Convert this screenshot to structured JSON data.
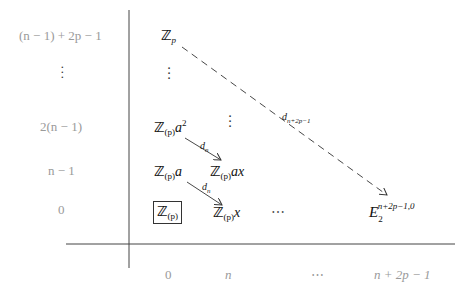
{
  "diagram": {
    "type": "spectral-sequence-page",
    "row_labels": [
      "(n − 1) + 2p − 1",
      "⋮",
      "2(n − 1)",
      "n − 1",
      "0"
    ],
    "column_labels": [
      "0",
      "n",
      "⋯",
      "n + 2p − 1"
    ],
    "entries": {
      "top": {
        "base": "ℤ",
        "sub": "p"
      },
      "col0_vdots": "⋮",
      "a2": {
        "base": "ℤ",
        "sub": "(p)",
        "tail": "a",
        "sup": "2"
      },
      "coln_vdots": "⋮",
      "a": {
        "base": "ℤ",
        "sub": "(p)",
        "tail": "a"
      },
      "ax": {
        "base": "ℤ",
        "sub": "(p)",
        "tail": "ax"
      },
      "origin_boxed": {
        "base": "ℤ",
        "sub": "(p)"
      },
      "x": {
        "base": "ℤ",
        "sub": "(p)",
        "tail": "x"
      },
      "row0_dots": "⋯",
      "target": {
        "base": "E",
        "sub": "2",
        "sup": "n+2p−1,0"
      }
    },
    "differentials": [
      {
        "label_base": "d",
        "label_sub": "n",
        "from": "Z(p)a^2",
        "to": "Z(p)ax",
        "style": "solid"
      },
      {
        "label_base": "d",
        "label_sub": "n",
        "from": "Z(p)a",
        "to": "Z(p)x",
        "style": "solid"
      },
      {
        "label_base": "d",
        "label_sub": "n+2p−1",
        "from": "Zp",
        "to": "E2^{n+2p-1,0}",
        "style": "dashed"
      }
    ],
    "colors": {
      "axis": "#444444",
      "axis_labels": "#9a9a9a",
      "entries": "#111111",
      "arrows": "#333333"
    }
  }
}
